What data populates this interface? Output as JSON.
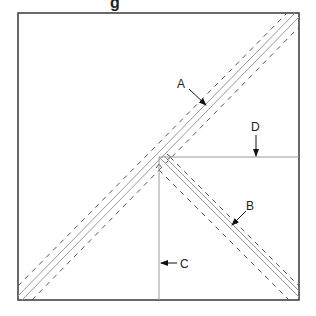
{
  "title_fragment": "g",
  "labels": {
    "a": "A",
    "b": "B",
    "c": "C",
    "d": "D"
  },
  "colors": {
    "frame": "#444444",
    "solid_line": "#9a9a9a",
    "dashed_line": "#555555",
    "arrow": "#111111",
    "text": "#222222"
  }
}
